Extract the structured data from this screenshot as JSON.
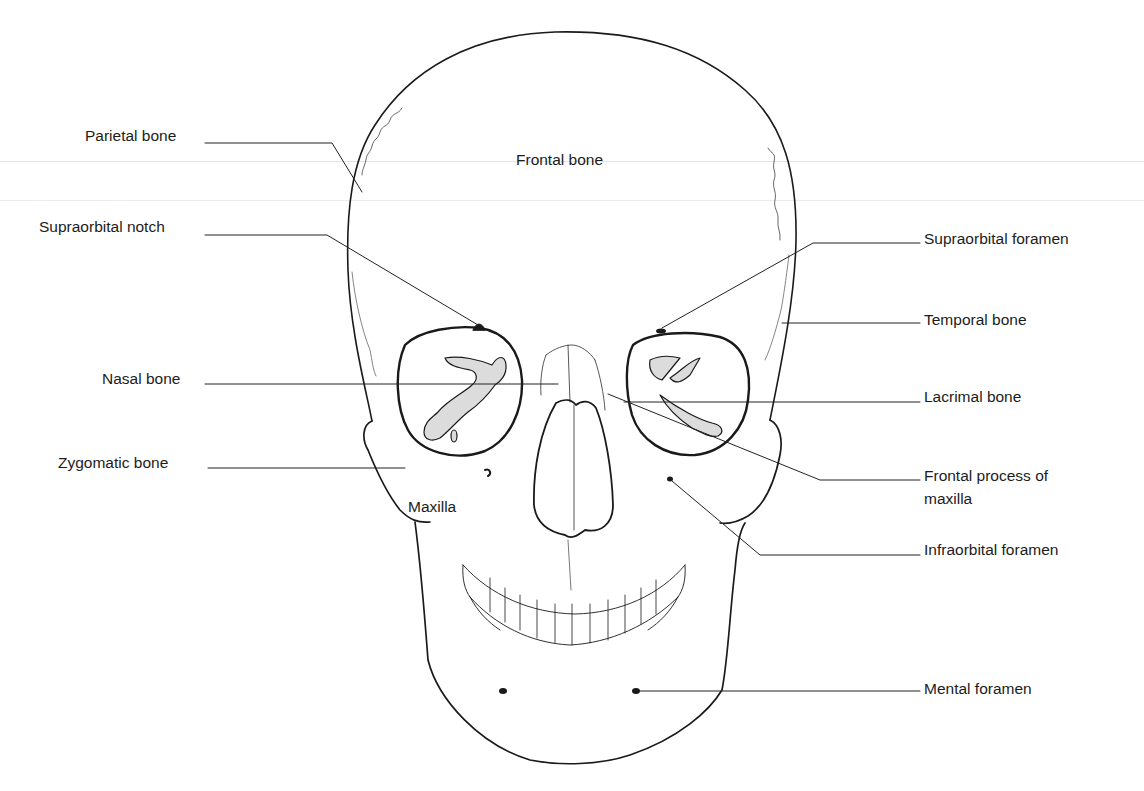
{
  "diagram": {
    "stroke_color": "#1a1a1a",
    "background": "#ffffff",
    "inner_labels": {
      "frontal_bone": "Frontal bone",
      "maxilla": "Maxilla"
    },
    "left_labels": [
      {
        "id": "parietal",
        "text": "Parietal bone"
      },
      {
        "id": "supraorbital-notch",
        "text": "Supraorbital notch"
      },
      {
        "id": "nasal",
        "text": "Nasal bone"
      },
      {
        "id": "zygomatic",
        "text": "Zygomatic bone"
      }
    ],
    "right_labels": [
      {
        "id": "supraorbital-foramen",
        "text": "Supraorbital foramen"
      },
      {
        "id": "temporal",
        "text": "Temporal bone"
      },
      {
        "id": "lacrimal",
        "text": "Lacrimal bone"
      },
      {
        "id": "frontal-process",
        "text": "Frontal process of",
        "text2": "maxilla"
      },
      {
        "id": "infraorbital-foramen",
        "text": "Infraorbital foramen"
      },
      {
        "id": "mental-foramen",
        "text": "Mental foramen"
      }
    ]
  }
}
